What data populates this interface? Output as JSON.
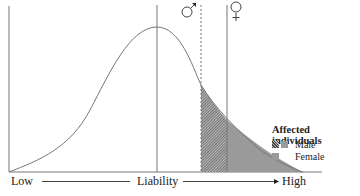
{
  "diagram": {
    "x_axis": {
      "low_label": "Low",
      "mid_label": "Liability",
      "high_label": "High"
    },
    "thresholds": [
      {
        "name": "male",
        "symbol": "♂",
        "style": "dashed"
      },
      {
        "name": "female",
        "symbol": "♀",
        "style": "solid"
      }
    ],
    "legend": {
      "title": "Affected individuals",
      "items": [
        {
          "label": "Male",
          "fill": "hatched-dark"
        },
        {
          "label": "Female",
          "fill": "gray"
        }
      ]
    },
    "colors": {
      "line": "#777777",
      "hatch": "#444444",
      "female_fill": "#999999"
    }
  }
}
